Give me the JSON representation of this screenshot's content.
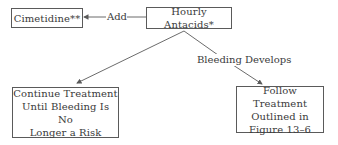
{
  "diagram": {
    "nodes": {
      "cimetidine": {
        "label": "Cimetidine**"
      },
      "antacids": {
        "label": "Hourly Antacids*"
      },
      "continue": {
        "label": "Continue Treatment Until Bleeding Is No Longer a Risk",
        "lines": [
          "Continue Treatment",
          "Until Bleeding Is No",
          "Longer a Risk"
        ]
      },
      "follow": {
        "label": "Follow Treatment Outlined in Figure 13–6",
        "lines": [
          "Follow Treatment",
          "Outlined in",
          "Figure 13–6"
        ]
      }
    },
    "edges": {
      "add": {
        "from": "antacids",
        "to": "cimetidine",
        "label": "Add"
      },
      "to_continue": {
        "from": "antacids",
        "to": "continue",
        "label": ""
      },
      "to_follow": {
        "from": "antacids",
        "to": "follow",
        "label": "Bleeding Develops"
      }
    },
    "colors": {
      "line": "#5a5a5a",
      "text": "#3a3a3a",
      "background": "#ffffff"
    }
  }
}
